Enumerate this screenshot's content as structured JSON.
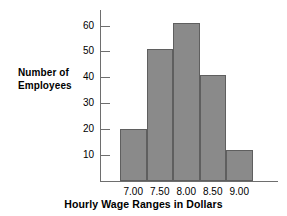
{
  "chart_data": {
    "type": "bar",
    "title": "",
    "subtitle": "",
    "xlabel": "Hourly Wage Ranges in Dollars",
    "ylabel": "Number of Employees",
    "ylabel_line1": "Number of",
    "ylabel_line2": "Employees",
    "categories": [
      "7.00",
      "7.50",
      "8.00",
      "8.50",
      "9.00"
    ],
    "values": [
      20,
      51,
      61,
      41,
      12
    ],
    "xticklabels": [
      "7.00",
      "7.50",
      "8.00",
      "8.50",
      "9.00"
    ],
    "yticklabels": [
      "10",
      "20",
      "30",
      "40",
      "50",
      "60"
    ],
    "yticks": [
      10,
      20,
      30,
      40,
      50,
      60
    ],
    "ylim": [
      0,
      66
    ],
    "grid": false,
    "legend": null,
    "bar_color": "#8a8a8a",
    "bar_edge_color": "#5f5f5f",
    "axis_color": "#6e6e6e",
    "background_color": "#ffffff"
  }
}
